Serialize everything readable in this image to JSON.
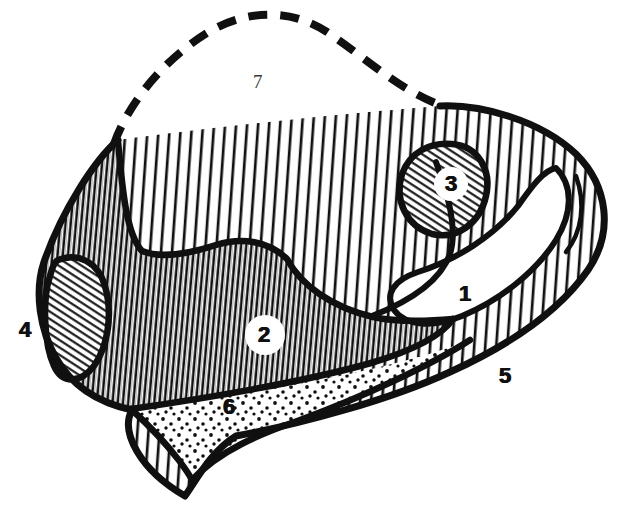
{
  "figure": {
    "background_color": "#ffffff",
    "ink_color": "#101010",
    "width": 640,
    "height": 519
  },
  "labels": [
    {
      "id": "label-1",
      "text": "1",
      "style": "bold",
      "x": 466,
      "y": 295,
      "region": "white-hook-cavity",
      "placement": "inside-white-cavity"
    },
    {
      "id": "label-2",
      "text": "2",
      "style": "bold",
      "x": 265,
      "y": 337,
      "region": "dense-vertical-hatch-body",
      "placement": "inside-white-disc"
    },
    {
      "id": "label-3",
      "text": "3",
      "style": "bold",
      "x": 451,
      "y": 186,
      "region": "small-diagonal-hatch-oval",
      "placement": "inside-white-disc"
    },
    {
      "id": "label-4",
      "text": "4",
      "style": "bold",
      "x": 26,
      "y": 331,
      "region": "left-diagonal-hatch-oval",
      "placement": "outside-left"
    },
    {
      "id": "label-5",
      "text": "5",
      "style": "bold",
      "x": 506,
      "y": 377,
      "region": "outer-margin",
      "placement": "outside-lower-right"
    },
    {
      "id": "label-6",
      "text": "6",
      "style": "bold",
      "x": 230,
      "y": 408,
      "region": "stippled-wedge",
      "placement": "inside-stipple"
    },
    {
      "id": "label-7",
      "text": "7",
      "style": "thin",
      "x": 259,
      "y": 83,
      "region": "dashed-open-zone",
      "placement": "inside-dashed-outline"
    }
  ],
  "regions": [
    {
      "name": "dashed-open-zone",
      "label": "7",
      "fill": "white",
      "boundary": "thick-dashed-arc",
      "description": "open crown area outlined by a heavy dashed curve"
    },
    {
      "name": "sparse-vertical-hatch-field",
      "label": "",
      "fill": "sparse-vertical-lines",
      "boundary": "solid",
      "description": "broad field of widely spaced near-vertical ruling"
    },
    {
      "name": "dense-vertical-hatch-body",
      "label": "2",
      "fill": "dense-vertical-lines",
      "boundary": "solid",
      "description": "dense close-ruled body occupying the left-centre"
    },
    {
      "name": "small-diagonal-hatch-oval",
      "label": "3",
      "fill": "fine-diagonal-lines",
      "boundary": "solid",
      "description": "small ovoid inclusion with fine diagonal ruling"
    },
    {
      "name": "white-hook-cavity",
      "label": "1",
      "fill": "white",
      "boundary": "solid",
      "description": "hook / claw shaped blank cavity on the right"
    },
    {
      "name": "left-diagonal-hatch-oval",
      "label": "4",
      "fill": "fine-diagonal-lines",
      "boundary": "solid",
      "description": "ovoid pocket on the left flank with diagonal ruling"
    },
    {
      "name": "stippled-wedge",
      "label": "6",
      "fill": "stipple-dots",
      "boundary": "solid",
      "description": "downward pointing stippled wedge along the base"
    },
    {
      "name": "outer-margin",
      "label": "5",
      "fill": "white",
      "boundary": "solid",
      "description": "outer contour / margin of the whole section"
    }
  ],
  "legend_keys": [
    "1",
    "2",
    "3",
    "4",
    "5",
    "6",
    "7"
  ]
}
